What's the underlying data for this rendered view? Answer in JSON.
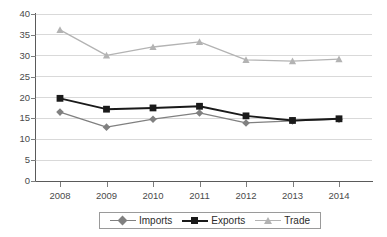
{
  "chart_data": {
    "type": "line",
    "title": "",
    "subtitle": "",
    "xlabel": "",
    "ylabel": "",
    "categories": [
      "2008",
      "2009",
      "2010",
      "2011",
      "2012",
      "2013",
      "2014"
    ],
    "x": [
      2008,
      2009,
      2010,
      2011,
      2012,
      2013,
      2014
    ],
    "ylim": [
      0,
      40
    ],
    "ytick_step": 5,
    "yticks": [
      40,
      35,
      30,
      25,
      20,
      15,
      10,
      5,
      0
    ],
    "grid": "horizontal",
    "legend_position": "bottom-center",
    "series": [
      {
        "name": "Imports",
        "marker": "diamond",
        "color": "#808080",
        "values": [
          16.5,
          12.9,
          14.8,
          16.3,
          13.9,
          14.4,
          14.8
        ]
      },
      {
        "name": "Exports",
        "marker": "square",
        "color": "#1a1a1a",
        "values": [
          19.8,
          17.2,
          17.5,
          17.9,
          15.6,
          14.5,
          14.9
        ]
      },
      {
        "name": "Trade",
        "marker": "triangle",
        "color": "#b3b3b3",
        "values": [
          36.2,
          30.1,
          32.1,
          33.3,
          29.0,
          28.7,
          29.2
        ]
      }
    ]
  },
  "axes": {
    "y_tick_labels": [
      "40",
      "35",
      "30",
      "25",
      "20",
      "15",
      "10",
      "5",
      "0"
    ],
    "x_tick_labels": [
      "2008",
      "2009",
      "2010",
      "2011",
      "2012",
      "2013",
      "2014"
    ]
  },
  "legend": {
    "items": [
      {
        "label": "Imports",
        "marker": "diamond-marker-icon",
        "color": "#808080"
      },
      {
        "label": "Exports",
        "marker": "square-marker-icon",
        "color": "#1a1a1a"
      },
      {
        "label": "Trade",
        "marker": "triangle-marker-icon",
        "color": "#b3b3b3"
      }
    ]
  },
  "style": {
    "grid_color": "#d9d9d9",
    "axis_color": "#5a5a5a",
    "background": "#ffffff"
  }
}
